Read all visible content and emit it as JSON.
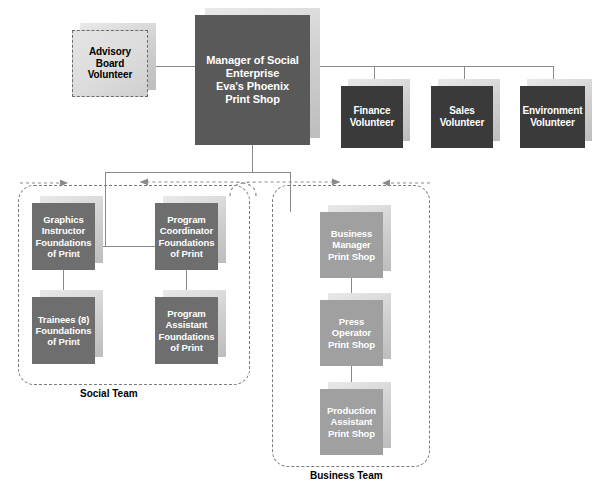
{
  "chart_type": "organization-chart",
  "title_node": {
    "name": "manager-of-social-enterprise",
    "lines": [
      "Manager of Social",
      "Enterprise",
      "Eva's Phoenix",
      "Print Shop"
    ],
    "text": "Manager of Social Enterprise Eva's Phoenix Print Shop",
    "fill": "#595959",
    "text_color": "#ffffff"
  },
  "advisory": {
    "name": "advisory-board-volunteer",
    "lines": [
      "Advisory",
      "Board",
      "Volunteer"
    ],
    "text": "Advisory Board Volunteer",
    "fill": "#dcdcdc",
    "text_color": "#000000",
    "border_style": "dashed"
  },
  "volunteers": [
    {
      "name": "finance-volunteer",
      "lines": [
        "Finance",
        "Volunteer"
      ],
      "text": "Finance Volunteer"
    },
    {
      "name": "sales-volunteer",
      "lines": [
        "Sales",
        "Volunteer"
      ],
      "text": "Sales Volunteer"
    },
    {
      "name": "environment-volunteer",
      "lines": [
        "Environment",
        "Volunteer"
      ],
      "text": "Environment Volunteer"
    }
  ],
  "volunteer_fill": "#3a3a3a",
  "social_team": {
    "label": "Social Team",
    "fill": "#6e6e6e",
    "nodes": [
      {
        "name": "graphics-instructor",
        "lines": [
          "Graphics",
          "Instructor",
          "Foundations",
          "of Print"
        ],
        "text": "Graphics Instructor Foundations of Print"
      },
      {
        "name": "program-coordinator",
        "lines": [
          "Program",
          "Coordinator",
          "Foundations",
          "of Print"
        ],
        "text": "Program Coordinator Foundations of Print"
      },
      {
        "name": "trainees",
        "lines": [
          "Trainees (8)",
          "Foundations",
          "of Print"
        ],
        "text": "Trainees (8) Foundations of Print"
      },
      {
        "name": "program-assistant",
        "lines": [
          "Program",
          "Assistant",
          "Foundations",
          "of Print"
        ],
        "text": "Program Assistant Foundations of Print"
      }
    ]
  },
  "business_team": {
    "label": "Business Team",
    "fill": "#a0a0a0",
    "nodes": [
      {
        "name": "business-manager",
        "lines": [
          "Business",
          "Manager",
          "Print Shop"
        ],
        "text": "Business Manager Print Shop"
      },
      {
        "name": "press-operator",
        "lines": [
          "Press",
          "Operator",
          "Print Shop"
        ],
        "text": "Press Operator Print Shop"
      },
      {
        "name": "production-assistant",
        "lines": [
          "Production",
          "Assistant",
          "Print Shop"
        ],
        "text": "Production Assistant Print Shop"
      }
    ]
  },
  "connector_color": "#8a8a8a",
  "background": "#ffffff"
}
